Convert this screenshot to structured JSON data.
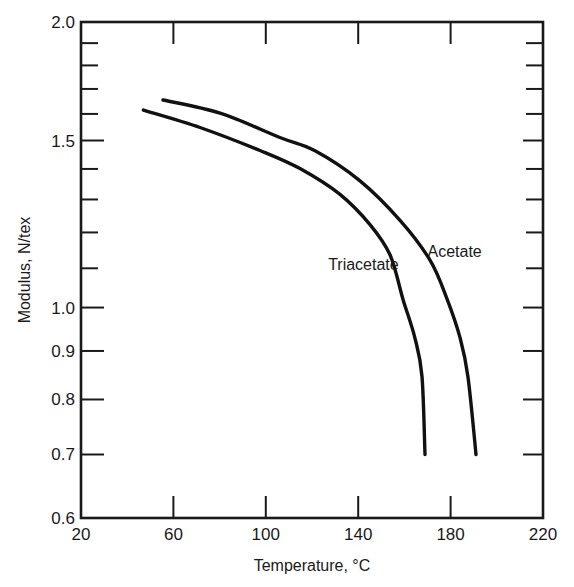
{
  "chart_data": {
    "type": "line",
    "title": "",
    "xlabel": "Temperature, °C",
    "ylabel": "Modulus, N/tex",
    "xlim": [
      20,
      220
    ],
    "ylim": [
      0.6,
      2.0
    ],
    "yscale": "log",
    "grid": false,
    "legend": "none (inline series labels)",
    "x_ticks": [
      20,
      60,
      100,
      140,
      180,
      220
    ],
    "x_tick_labels": [
      "20",
      "60",
      "100",
      "140",
      "180",
      "220"
    ],
    "y_labeled_ticks": [
      0.6,
      0.7,
      0.8,
      0.9,
      1.0,
      1.5,
      2.0
    ],
    "y_tick_labels": [
      "0.6",
      "0.7",
      "0.8",
      "0.9",
      "1.0",
      "1.5",
      "2.0"
    ],
    "y_minor_ticks": [
      1.1,
      1.2,
      1.3,
      1.4,
      1.6,
      1.7,
      1.8,
      1.9
    ],
    "series": [
      {
        "name": "Triacetate",
        "x": [
          47,
          71.5,
          97.5,
          114.8,
          132.1,
          145.1,
          153.8,
          159.4,
          164.6,
          167.6,
          168.9
        ],
        "y": [
          1.615,
          1.548,
          1.464,
          1.401,
          1.316,
          1.223,
          1.136,
          1.02,
          0.928,
          0.846,
          0.7
        ],
        "label_anchor": {
          "x": 127,
          "y": 1.095
        }
      },
      {
        "name": "Acetate",
        "x": [
          55.5,
          80.2,
          106.1,
          121.3,
          140.8,
          158.1,
          171.1,
          178.4,
          184.1,
          187.5,
          191.0
        ],
        "y": [
          1.655,
          1.603,
          1.511,
          1.463,
          1.36,
          1.236,
          1.122,
          1.022,
          0.929,
          0.846,
          0.7
        ],
        "label_anchor": {
          "x": 170,
          "y": 1.13
        }
      }
    ]
  }
}
